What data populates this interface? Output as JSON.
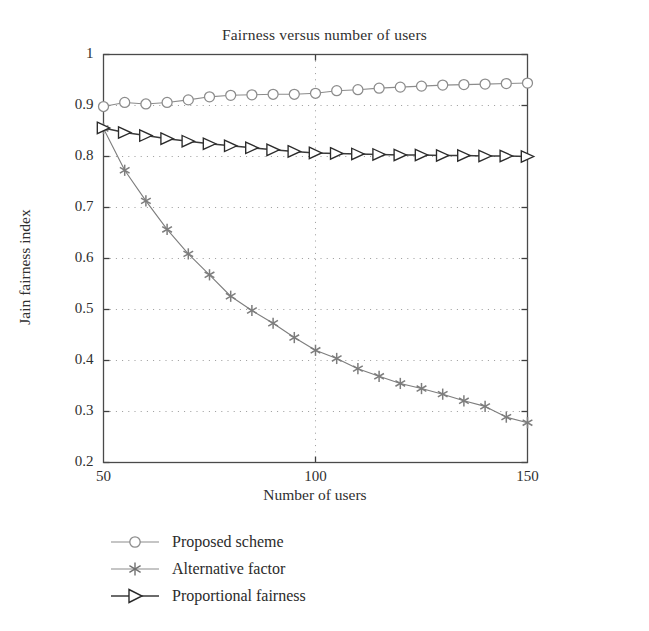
{
  "chart_data": {
    "type": "line",
    "title": "Fairness versus number of users",
    "xlabel": "Number of users",
    "ylabel": "Jain fairness index",
    "xlim": [
      50,
      150
    ],
    "ylim": [
      0.2,
      1
    ],
    "xticks": [
      50,
      100,
      150
    ],
    "xtick_labels": [
      "50",
      "100",
      "150"
    ],
    "yticks": [
      0.2,
      0.3,
      0.4,
      0.5,
      0.6,
      0.7,
      0.8,
      0.9,
      1
    ],
    "ytick_labels": [
      "0.2",
      "0.3",
      "0.4",
      "0.5",
      "0.6",
      "0.7",
      "0.8",
      "0.9",
      "1"
    ],
    "grid": "dotted",
    "legend_position": "below-left",
    "x": [
      50,
      55,
      60,
      65,
      70,
      75,
      80,
      85,
      90,
      95,
      100,
      105,
      110,
      115,
      120,
      125,
      130,
      135,
      140,
      145,
      150
    ],
    "series": [
      {
        "name": "Proposed scheme",
        "marker": "circle",
        "color": "#8c8c8c",
        "values": [
          0.898,
          0.906,
          0.903,
          0.906,
          0.911,
          0.917,
          0.92,
          0.921,
          0.922,
          0.922,
          0.924,
          0.929,
          0.931,
          0.934,
          0.936,
          0.938,
          0.94,
          0.941,
          0.942,
          0.943,
          0.944
        ]
      },
      {
        "name": "Alternative factor",
        "marker": "asterisk",
        "color": "#7d7d7d",
        "values": [
          0.855,
          0.773,
          0.713,
          0.657,
          0.609,
          0.568,
          0.526,
          0.498,
          0.473,
          0.445,
          0.42,
          0.404,
          0.384,
          0.369,
          0.355,
          0.345,
          0.334,
          0.321,
          0.31,
          0.289,
          0.278
        ]
      },
      {
        "name": "Proportional fairness",
        "marker": "right-triangle",
        "color": "#3a3a3a",
        "values": [
          0.856,
          0.847,
          0.841,
          0.835,
          0.83,
          0.825,
          0.821,
          0.817,
          0.813,
          0.81,
          0.807,
          0.806,
          0.805,
          0.804,
          0.803,
          0.803,
          0.802,
          0.802,
          0.801,
          0.801,
          0.8
        ]
      }
    ]
  },
  "legend": {
    "items": [
      {
        "label": "Proposed scheme"
      },
      {
        "label": "Alternative factor"
      },
      {
        "label": "Proportional fairness"
      }
    ]
  }
}
